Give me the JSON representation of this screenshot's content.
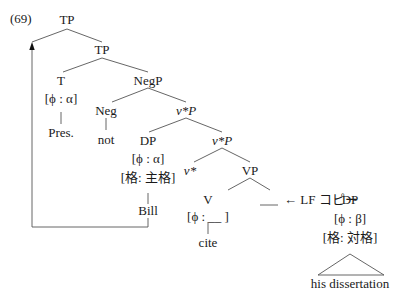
{
  "example_number": "(69)",
  "nodes": {
    "tp_top": "TP",
    "tp_inner": "TP",
    "t": "T",
    "t_feature": "[ϕ : α]",
    "t_terminal": "Pres.",
    "negp": "NegP",
    "neg": "Neg",
    "neg_terminal": "not",
    "vstarp_upper": "v*P",
    "dp_subject": "DP",
    "dp_subject_phi": "[ϕ : α]",
    "dp_subject_case": "[格: 主格]",
    "dp_subject_terminal": "Bill",
    "vstarp_lower": "v*P",
    "vstar": "v*",
    "vp": "VP",
    "v": "V",
    "v_feature": "[ϕ : __ ]",
    "v_terminal": "cite",
    "lf_copy_label": "← LF コピー",
    "dp_object": "DP",
    "dp_object_phi": "[ϕ : β]",
    "dp_object_case": "[格: 対格]",
    "dp_object_terminal": "his dissertation"
  },
  "annotations": {
    "movement_arrow": "Subject DP Bill raises to Spec-TP",
    "lf_copy_arrow": "Object DP copied into VP complement at LF"
  }
}
